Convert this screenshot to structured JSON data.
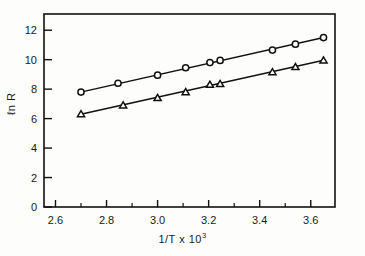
{
  "chart_data": {
    "type": "scatter",
    "title": "",
    "subtitle": "",
    "xlabel": "1/T  x  10",
    "xlabel_exponent": "3",
    "ylabel": "ℓn R",
    "xlim": [
      2.555,
      3.695
    ],
    "ylim": [
      0,
      13.1
    ],
    "xticks": [
      2.6,
      2.8,
      3.0,
      3.2,
      3.4,
      3.6
    ],
    "xtick_labels": [
      "2.6",
      "2.8",
      "3.0",
      "3.2",
      "3.4",
      "3.6"
    ],
    "xminor_ticks": [
      2.7,
      2.9,
      3.1,
      3.3,
      3.5
    ],
    "yticks": [
      0,
      2,
      4,
      6,
      8,
      10,
      12
    ],
    "ytick_labels": [
      "0",
      "2",
      "4",
      "6",
      "8",
      "10",
      "12"
    ],
    "grid": false,
    "legend": "none",
    "frame": "box",
    "tick_direction": "in",
    "line_color": "#111111",
    "marker_face_color": "#ffffff",
    "background": "#fdfdfc",
    "series": [
      {
        "name": "upper-series",
        "marker": "circle",
        "marker_size": 6.2,
        "x": [
          2.7,
          2.845,
          3.0,
          3.11,
          3.205,
          3.245,
          3.45,
          3.54,
          3.65
        ],
        "values": [
          7.8,
          8.4,
          8.95,
          9.45,
          9.8,
          9.95,
          10.65,
          11.05,
          11.5
        ],
        "fit_x": [
          2.695,
          3.655
        ],
        "fit_y": [
          7.78,
          11.52
        ]
      },
      {
        "name": "lower-series",
        "marker": "triangle",
        "marker_size": 6.6,
        "x": [
          2.7,
          2.865,
          3.0,
          3.11,
          3.205,
          3.245,
          3.45,
          3.54,
          3.65
        ],
        "values": [
          6.3,
          6.9,
          7.4,
          7.8,
          8.3,
          8.35,
          9.15,
          9.5,
          9.95
        ],
        "fit_x": [
          2.695,
          3.655
        ],
        "fit_y": [
          6.28,
          9.98
        ]
      }
    ]
  }
}
